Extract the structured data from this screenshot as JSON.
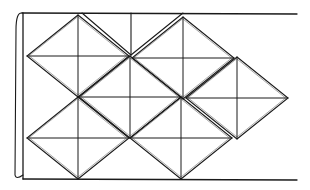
{
  "diagram": {
    "type": "tessellation",
    "stroke_color": "#1a1a1a",
    "background_color": "#ffffff",
    "frame": {
      "top": {
        "x1": 22,
        "y1": 13,
        "x2": 297,
        "y2": 14
      },
      "bottom": {
        "x1": 23,
        "y1": 179,
        "x2": 297,
        "y2": 180
      },
      "left": {
        "x1": 23,
        "y1": 13,
        "x2": 23,
        "y2": 179
      },
      "curl": "M22 13 Q16 12 16 30 L15 175 Q16 180 23 175"
    },
    "tiles": [
      {
        "id": "tile-top-left",
        "cx": 78,
        "cy": 56,
        "rx": 51,
        "ry": 41
      },
      {
        "id": "tile-top-right",
        "cx": 183,
        "cy": 58,
        "rx": 51,
        "ry": 41
      },
      {
        "id": "tile-middle-center",
        "cx": 130,
        "cy": 97,
        "rx": 51,
        "ry": 41
      },
      {
        "id": "tile-middle-right",
        "cx": 237,
        "cy": 98,
        "rx": 51,
        "ry": 41
      },
      {
        "id": "tile-bottom-left",
        "cx": 78,
        "cy": 138,
        "rx": 51,
        "ry": 41
      },
      {
        "id": "tile-bottom-center",
        "cx": 181,
        "cy": 138,
        "rx": 51,
        "ry": 41
      }
    ],
    "partial_tile": {
      "id": "tile-top-partial",
      "lines": [
        {
          "x1": 82,
          "y1": 13,
          "x2": 131,
          "y2": 55
        },
        {
          "x1": 183,
          "y1": 13,
          "x2": 131,
          "y2": 55
        },
        {
          "x1": 131,
          "y1": 13,
          "x2": 131,
          "y2": 55
        }
      ]
    }
  }
}
